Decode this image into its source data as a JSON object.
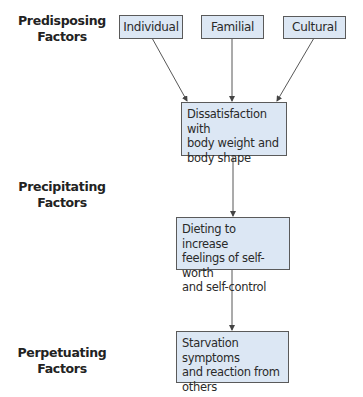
{
  "stage_labels": {
    "predisposing": [
      "Predisposing",
      "Factors"
    ],
    "precipitating": [
      "Precipitating",
      "Factors"
    ],
    "perpetuating": [
      "Perpetuating",
      "Factors"
    ]
  },
  "nodes": {
    "individual": "Individual",
    "familial": "Familial",
    "cultural": "Cultural",
    "dissatisfaction": [
      "Dissatisfaction with",
      "body weight and",
      "body shape"
    ],
    "dieting": [
      "Dieting to increase",
      "feelings of self-worth",
      "and self-control"
    ],
    "starvation": [
      "Starvation symptoms",
      "and reaction from",
      "others"
    ]
  },
  "edges": [
    {
      "from": "individual",
      "to": "dissatisfaction"
    },
    {
      "from": "familial",
      "to": "dissatisfaction"
    },
    {
      "from": "cultural",
      "to": "dissatisfaction"
    },
    {
      "from": "dissatisfaction",
      "to": "dieting"
    },
    {
      "from": "dieting",
      "to": "starvation"
    }
  ],
  "colors": {
    "box_fill": "#dce7f4",
    "box_border": "#5a5a5a",
    "arrow": "#444444",
    "label_text": "#222222"
  }
}
